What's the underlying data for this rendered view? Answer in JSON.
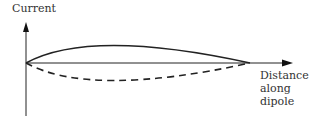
{
  "diagram": {
    "y_axis_label": "Current",
    "x_axis_label": "Distance\nalong\ndipole",
    "curves": [
      {
        "name": "current-positive",
        "style": "solid"
      },
      {
        "name": "current-negative",
        "style": "dashed"
      }
    ],
    "colors": {
      "line": "#222222",
      "text": "#333333"
    }
  }
}
